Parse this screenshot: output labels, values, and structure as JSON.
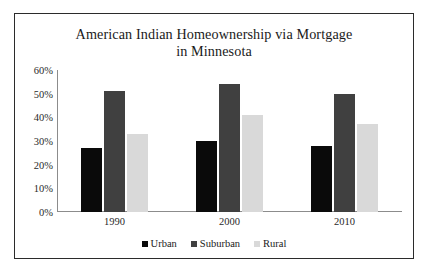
{
  "chart_data": {
    "type": "bar",
    "title": "American Indian Homeownership via Mortgage in Minnesota",
    "title_lines": [
      "American Indian Homeownership via Mortgage",
      "in Minnesota"
    ],
    "categories": [
      "1990",
      "2000",
      "2010"
    ],
    "series": [
      {
        "name": "Urban",
        "color": "#0a0a0a",
        "values": [
          27,
          30,
          28
        ]
      },
      {
        "name": "Suburban",
        "color": "#404040",
        "values": [
          51,
          54,
          50
        ]
      },
      {
        "name": "Rural",
        "color": "#d9d9d9",
        "values": [
          33,
          41,
          37
        ]
      }
    ],
    "xlabel": "",
    "ylabel": "",
    "ylim": [
      0,
      60
    ],
    "ytick_values": [
      0,
      10,
      20,
      30,
      40,
      50,
      60
    ],
    "ytick_labels": [
      "0%",
      "10%",
      "20%",
      "30%",
      "40%",
      "50%",
      "60%"
    ],
    "grid": false,
    "legend_position": "bottom",
    "value_format": "percent"
  },
  "frame": {
    "border_color": "#2b2b2b",
    "background": "#ffffff",
    "axis_color": "#8c8c8c"
  }
}
